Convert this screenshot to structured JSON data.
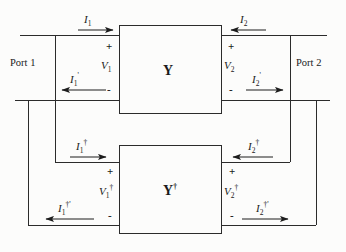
{
  "figure": {
    "kind": "two-port-network-diagram",
    "background_color": "#fcfcfb",
    "line_color": "#2b2b2b",
    "text_color": "#1a1a1a"
  },
  "blocks": {
    "upper": {
      "name": "Y",
      "dagger": ""
    },
    "lower": {
      "name": "Y",
      "dagger": "†"
    }
  },
  "ports": {
    "left": "Port 1",
    "right": "Port 2"
  },
  "upper_network": {
    "currents": {
      "i1": {
        "base": "I",
        "sub": "1",
        "sup": "",
        "direction": "right"
      },
      "i1p": {
        "base": "I",
        "sub": "1",
        "sup": "'",
        "direction": "left"
      },
      "i2": {
        "base": "I",
        "sub": "2",
        "sup": "",
        "direction": "left"
      },
      "i2p": {
        "base": "I",
        "sub": "2",
        "sup": "'",
        "direction": "right"
      }
    },
    "voltages": {
      "v1": {
        "base": "V",
        "sub": "1",
        "sup": "",
        "plus": "+",
        "minus": "-"
      },
      "v2": {
        "base": "V",
        "sub": "2",
        "sup": "",
        "plus": "+",
        "minus": "-"
      }
    }
  },
  "lower_network": {
    "currents": {
      "i1d": {
        "base": "I",
        "sub": "1",
        "sup": "†",
        "direction": "right"
      },
      "i1dp": {
        "base": "I",
        "sub": "1",
        "sup": "†'",
        "direction": "left"
      },
      "i2d": {
        "base": "I",
        "sub": "2",
        "sup": "†",
        "direction": "left"
      },
      "i2dp": {
        "base": "I",
        "sub": "2",
        "sup": "†'",
        "direction": "right"
      }
    },
    "voltages": {
      "v1d": {
        "base": "V",
        "sub": "1",
        "sup": "†",
        "plus": "+",
        "minus": "-"
      },
      "v2d": {
        "base": "V",
        "sub": "2",
        "sup": "†",
        "plus": "+",
        "minus": "-"
      }
    }
  }
}
